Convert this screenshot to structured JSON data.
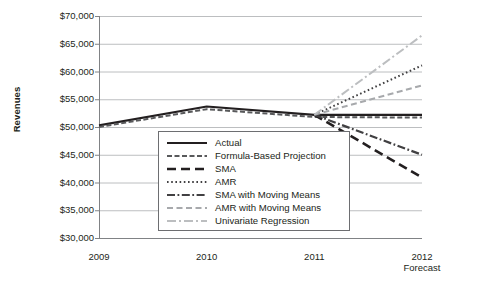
{
  "chart_data": {
    "type": "line",
    "title": "",
    "xlabel": "",
    "ylabel": "Revenues",
    "x": [
      "2009",
      "2010",
      "2011",
      "2012"
    ],
    "x_sublabels": [
      "",
      "",
      "",
      "Forecast"
    ],
    "ylim": [
      30000,
      70000
    ],
    "ytick_step": 5000,
    "ytick_labels": [
      "$70,000",
      "$65,000",
      "$60,000",
      "$55,000",
      "$50,000",
      "$45,000",
      "$40,000",
      "$35,000",
      "$30,000"
    ],
    "ytick_values": [
      70000,
      65000,
      60000,
      55000,
      50000,
      45000,
      40000,
      35000,
      30000
    ],
    "grid": true,
    "legend_position": "inside-bottom-center",
    "series": [
      {
        "name": "Actual",
        "style": "solid",
        "color": "#231f20",
        "width": 2.2,
        "values": [
          50300,
          53700,
          52200,
          52200
        ]
      },
      {
        "name": "Formula-Based Projection",
        "style": "dashed",
        "color": "#58595b",
        "width": 2.0,
        "values": [
          50000,
          53200,
          51800,
          51700
        ]
      },
      {
        "name": "SMA",
        "style": "long-dash",
        "color": "#231f20",
        "width": 2.6,
        "values": [
          null,
          null,
          52200,
          40900
        ]
      },
      {
        "name": "AMR",
        "style": "dotted",
        "color": "#414042",
        "width": 2.0,
        "values": [
          null,
          null,
          52200,
          61100
        ]
      },
      {
        "name": "SMA with Moving Means",
        "style": "dash-dot",
        "color": "#414042",
        "width": 2.2,
        "values": [
          null,
          null,
          52200,
          45000
        ]
      },
      {
        "name": "AMR with Moving Means",
        "style": "dashed-light",
        "color": "#a7a9ac",
        "width": 2.0,
        "values": [
          null,
          null,
          52200,
          57500
        ]
      },
      {
        "name": "Univariate Regression",
        "style": "dash-dot-light",
        "color": "#bcbec0",
        "width": 2.0,
        "values": [
          null,
          null,
          52200,
          66500
        ]
      }
    ]
  },
  "legend": {
    "items": [
      {
        "label": "Actual",
        "swatch": "solid-black-line"
      },
      {
        "label": "Formula-Based Projection",
        "swatch": "dashed-gray-line"
      },
      {
        "label": "SMA",
        "swatch": "long-dash-black-line"
      },
      {
        "label": "AMR",
        "swatch": "dotted-gray-line"
      },
      {
        "label": "SMA with Moving Means",
        "swatch": "dash-dot-gray-line"
      },
      {
        "label": "AMR with Moving Means",
        "swatch": "dashed-light-gray-line"
      },
      {
        "label": "Univariate Regression",
        "swatch": "dash-dot-light-gray-line"
      }
    ]
  },
  "axes": {
    "y_title": "Revenues"
  }
}
